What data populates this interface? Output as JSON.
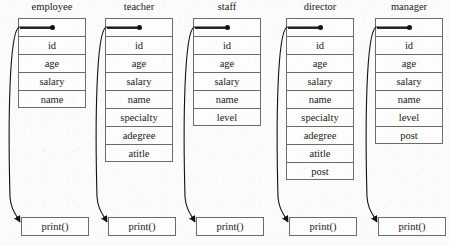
{
  "diagram": {
    "type": "uml-class-inheritance",
    "background_color": "#fbfbfb",
    "line_color": "#6b6b6b",
    "text_color": "#1a1a1a",
    "pointer_row_label": "",
    "classes": [
      {
        "name": "employee",
        "attributes": [
          "id",
          "age",
          "salary",
          "name"
        ],
        "methods": [
          "print()"
        ]
      },
      {
        "name": "teacher",
        "attributes": [
          "id",
          "age",
          "salary",
          "name",
          "specialty",
          "adegree",
          "atitle"
        ],
        "methods": [
          "print()"
        ]
      },
      {
        "name": "staff",
        "attributes": [
          "id",
          "age",
          "salary",
          "name",
          "level"
        ],
        "methods": [
          "print()"
        ]
      },
      {
        "name": "director",
        "attributes": [
          "id",
          "age",
          "salary",
          "name",
          "specialty",
          "adegree",
          "atitle",
          "post"
        ],
        "methods": [
          "print()"
        ]
      },
      {
        "name": "manager",
        "attributes": [
          "id",
          "age",
          "salary",
          "name",
          "level",
          "post"
        ],
        "methods": [
          "print()"
        ]
      }
    ]
  }
}
